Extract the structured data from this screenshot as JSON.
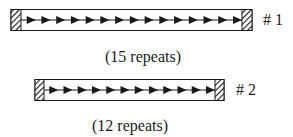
{
  "figure": {
    "elements": [
      {
        "id": "1",
        "label": "# 1",
        "caption": "(15 repeats)",
        "repeats": 15
      },
      {
        "id": "2",
        "label": "# 2",
        "caption": "(12 repeats)",
        "repeats": 12
      }
    ]
  },
  "colors": {
    "stroke": "#1a1a1a",
    "background": "#ffffff"
  }
}
